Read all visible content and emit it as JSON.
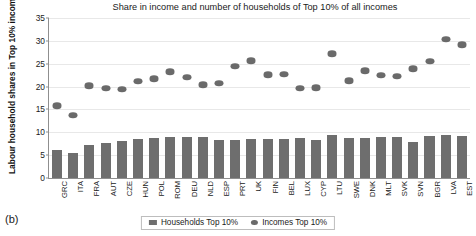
{
  "panel_letter": "(b)",
  "legend": {
    "items": [
      {
        "label": "Households Top 10%",
        "marker": "bar-swatch",
        "color": "#6e6e6e"
      },
      {
        "label": "Incomes Top 10%",
        "marker": "dot-swatch",
        "color": "#6a6a6a"
      }
    ]
  },
  "chart_data": {
    "type": "bar",
    "title": "Share in income and number of households of Top 10% of all incomes",
    "xlabel": "",
    "ylabel": "Labour household shares in Top 10% incomes and households",
    "ylim": [
      0,
      35
    ],
    "yticks": [
      0,
      5,
      10,
      15,
      20,
      25,
      30,
      35
    ],
    "grid": true,
    "legend_position": "bottom",
    "categories": [
      "GRC",
      "ITA",
      "FRA",
      "AUT",
      "CZE",
      "HUN",
      "POL",
      "ROM",
      "DEU",
      "NLD",
      "ESP",
      "PRT",
      "UK",
      "FIN",
      "BEL",
      "LUX",
      "CYP",
      "LTU",
      "SWE",
      "DNK",
      "MLT",
      "SVK",
      "SVN",
      "BGR",
      "LVA",
      "EST"
    ],
    "series": [
      {
        "name": "Households Top 10%",
        "type": "bar",
        "color": "#6e6e6e",
        "values": [
          6.2,
          5.5,
          7.3,
          7.7,
          8.1,
          8.6,
          8.7,
          9.0,
          8.9,
          8.9,
          8.4,
          8.3,
          8.5,
          8.5,
          8.6,
          8.8,
          8.3,
          9.4,
          8.7,
          8.7,
          8.9,
          8.9,
          7.8,
          9.3,
          9.4,
          9.3
        ]
      },
      {
        "name": "Incomes Top 10%",
        "type": "scatter",
        "color": "#6a6a6a",
        "values": [
          15.8,
          13.8,
          20.2,
          19.6,
          19.4,
          21.2,
          21.7,
          23.3,
          22.0,
          20.4,
          20.7,
          24.5,
          25.7,
          22.6,
          22.7,
          19.6,
          19.8,
          27.2,
          21.3,
          23.5,
          22.5,
          22.3,
          23.9,
          25.6,
          30.4,
          29.2
        ]
      }
    ]
  }
}
